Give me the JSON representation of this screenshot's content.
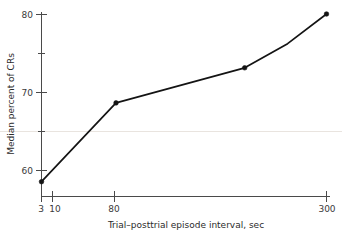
{
  "chart_data": {
    "type": "line",
    "title": "",
    "xlabel": "Trial–posttrial episode interval, sec",
    "ylabel": "Median percent of CRs",
    "x": [
      3,
      10,
      80,
      160,
      300
    ],
    "values": [
      58.5,
      68.6,
      73.1,
      76.2,
      80.0
    ],
    "series": [
      {
        "name": "Median percent of CRs",
        "values": [
          58.5,
          68.6,
          73.1,
          76.2,
          80.0
        ]
      }
    ],
    "xscale": "log",
    "xlim": [
      3,
      300
    ],
    "ylim": [
      55.5,
      81.5
    ],
    "x_tick_labels": [
      "3",
      "10",
      "80",
      "300"
    ],
    "x_tick_values": [
      3,
      10,
      80,
      300
    ],
    "y_tick_labels": [
      "60",
      "70",
      "80"
    ],
    "y_tick_values": [
      60,
      70,
      80
    ],
    "y_minor_ticks": [
      65,
      75
    ],
    "grid": false,
    "legend": false,
    "legend_position": "none",
    "marker": "filled-circle",
    "line_color": "#141414",
    "marker_color": "#141414",
    "axis_color": "#4a4a4a"
  },
  "axes": {
    "y_title": "Median percent of CRs",
    "x_title": "Trial–posttrial episode interval, sec",
    "y_ticks": [
      {
        "label": "80"
      },
      {
        "label": "70"
      },
      {
        "label": "60"
      }
    ],
    "x_ticks": [
      {
        "label": "3"
      },
      {
        "label": "10"
      },
      {
        "label": "80"
      },
      {
        "label": "300"
      }
    ]
  }
}
